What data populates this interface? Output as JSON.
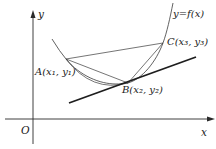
{
  "diagram": {
    "type": "function-graph-with-chords-and-tangent",
    "axes": {
      "x_label": "x",
      "y_label": "y",
      "origin_label": "O"
    },
    "curve": {
      "label": "y=f(x)",
      "shape": "convex (concave up)"
    },
    "points": [
      {
        "id": "A",
        "label": "A(x₁, y₁)"
      },
      {
        "id": "B",
        "label": "B(x₂, y₂)"
      },
      {
        "id": "C",
        "label": "C(x₃, y₃)"
      }
    ],
    "segments": [
      "AB",
      "AC",
      "BC"
    ],
    "tangent_line": {
      "at_point": "B"
    },
    "colors": {
      "stroke": "#2a2a2a",
      "background": "#ffffff"
    }
  }
}
